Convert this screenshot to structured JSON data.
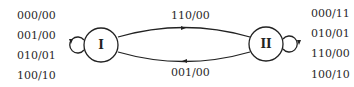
{
  "diagram": {
    "type": "state-machine",
    "states": [
      {
        "id": "I",
        "label": "I"
      },
      {
        "id": "II",
        "label": "II"
      }
    ],
    "self_loops": {
      "I": [
        "000/00",
        "001/00",
        "010/01",
        "100/10"
      ],
      "II": [
        "000/11",
        "010/01",
        "110/00",
        "100/10"
      ]
    },
    "transitions": [
      {
        "from": "I",
        "to": "II",
        "label": "110/00"
      },
      {
        "from": "II",
        "to": "I",
        "label": "001/00"
      }
    ]
  }
}
